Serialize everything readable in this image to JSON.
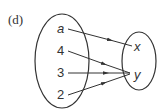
{
  "figure_label": "(d)",
  "domain_set": {
    "elements": [
      "a",
      "4",
      "3",
      "2"
    ]
  },
  "range_set": {
    "elements": [
      "x",
      "y"
    ]
  },
  "mappings": [
    {
      "from": "a",
      "to": "x"
    },
    {
      "from": "4",
      "to": "y"
    },
    {
      "from": "3",
      "to": "y"
    },
    {
      "from": "2",
      "to": "y"
    }
  ]
}
